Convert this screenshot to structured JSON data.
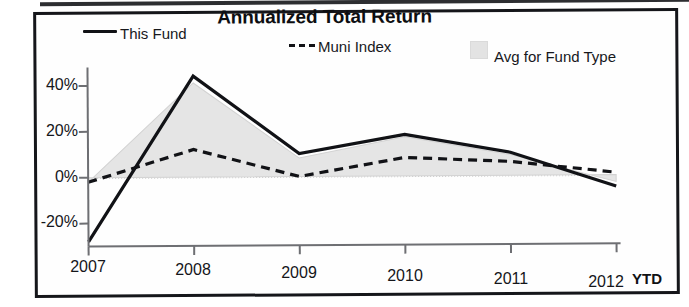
{
  "chart_data": {
    "type": "area",
    "title": "Annualized Total Return",
    "xlabel": "",
    "ylabel": "",
    "x": [
      "2007",
      "2008",
      "2009",
      "2010",
      "2011",
      "2012"
    ],
    "categories": [
      "2007",
      "2008",
      "2009",
      "2010",
      "2011",
      "2012"
    ],
    "x_suffix_label": "YTD",
    "ylim": [
      -30,
      48
    ],
    "yticks": [
      -20,
      0,
      20,
      40
    ],
    "ytick_labels": [
      "-20%",
      "0%",
      "20%",
      "40%"
    ],
    "grid": false,
    "legend_position": "top",
    "series": [
      {
        "name": "This Fund",
        "style": "solid-line",
        "color": "#111216",
        "values": [
          -28,
          44,
          10,
          18,
          10,
          -5
        ]
      },
      {
        "name": "Muni Index",
        "style": "dashed-line",
        "color": "#111216",
        "values": [
          -2,
          12,
          0,
          8,
          6,
          1
        ]
      },
      {
        "name": "Avg for Fund Type",
        "style": "filled-area",
        "color": "#e3e3e3",
        "values": [
          -2,
          41,
          8,
          17,
          9,
          -3
        ]
      }
    ]
  },
  "chart": {
    "title": "Annualized Total Return",
    "legend": [
      {
        "label": "This Fund",
        "marker": "solid-line-swatch"
      },
      {
        "label": "Muni Index",
        "marker": "dashed-line-swatch"
      },
      {
        "label": "Avg for Fund Type",
        "marker": "gray-box-swatch"
      }
    ],
    "y_axis": {
      "ticks": [
        "40%",
        "20%",
        "0%",
        "-20%"
      ]
    },
    "x_axis": {
      "ticks": [
        "2007",
        "2008",
        "2009",
        "2010",
        "2011",
        "2012"
      ],
      "suffix": "YTD"
    }
  },
  "colors": {
    "line": "#111216",
    "area_fill": "#e3e3e3",
    "frame": "#15161a",
    "background": "#ffffff"
  }
}
